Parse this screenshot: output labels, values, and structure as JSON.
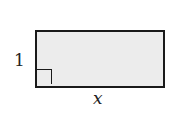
{
  "diagram": {
    "shape": "rectangle",
    "fill_color": "#ececec",
    "stroke_color": "#1a1a1a",
    "side_label": "1",
    "base_label": "x",
    "right_angle_marker": "bottom-left"
  }
}
